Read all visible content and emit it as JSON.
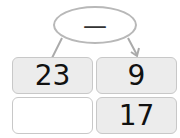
{
  "operation": {
    "symbol": "—",
    "meaning": "subtraction"
  },
  "grid": {
    "row1": {
      "left": "23",
      "right": "9"
    },
    "row2": {
      "left": "",
      "right": "17"
    }
  },
  "colors": {
    "cell_fill": "#ececec",
    "blank_fill": "#ffffff",
    "border": "#c8c8c8",
    "oval_border": "#b8b8b8"
  }
}
